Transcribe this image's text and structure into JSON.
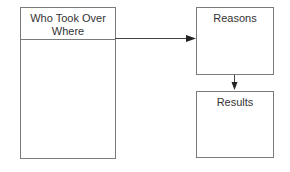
{
  "diagram": {
    "boxes": {
      "who": {
        "title_line1": "Who Took Over",
        "title_line2": "Where"
      },
      "reasons": {
        "title": "Reasons"
      },
      "results": {
        "title": "Results"
      }
    },
    "connectors": [
      {
        "from": "who",
        "to": "reasons",
        "direction": "right"
      },
      {
        "from": "reasons",
        "to": "results",
        "direction": "down"
      }
    ],
    "colors": {
      "line": "#7a7a7a",
      "arrow": "#222222",
      "text": "#333333"
    }
  }
}
